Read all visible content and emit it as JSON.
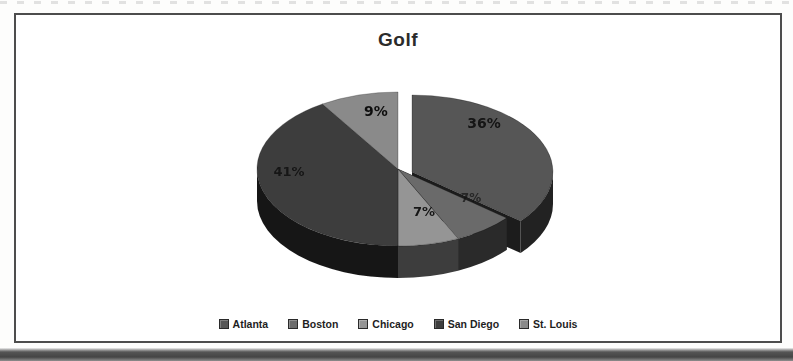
{
  "chart_data": {
    "type": "pie",
    "title": "Golf",
    "labels": [
      "Atlanta",
      "Boston",
      "Chicago",
      "San Diego",
      "St. Louis"
    ],
    "values": [
      36,
      7,
      7,
      41,
      9
    ],
    "value_labels": [
      "36%",
      "7%",
      "7%",
      "41%",
      "9%"
    ],
    "unit": "%",
    "colors": [
      "#575757",
      "#6b6b6b",
      "#959595",
      "#3e3e3e",
      "#8a8a8a"
    ],
    "label_color": "#101010",
    "exploded_slice": "Atlanta",
    "legend_position": "bottom",
    "style": "3d-exploded-grayscale"
  }
}
